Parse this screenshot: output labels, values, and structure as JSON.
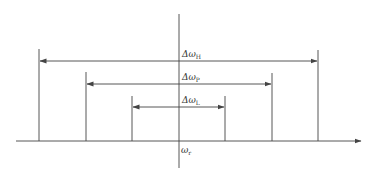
{
  "diagram": {
    "type": "bandwidth-diagram",
    "axis": {
      "label": "ω",
      "subscript": "r",
      "color": "#444444"
    },
    "bands": [
      {
        "id": "H",
        "label": "Δω",
        "subscript": "H",
        "left_x": 39,
        "right_x": 318,
        "top_y": 49,
        "arrow_y": 61
      },
      {
        "id": "P",
        "label": "Δω",
        "subscript": "P",
        "left_x": 86,
        "right_x": 272,
        "top_y": 72,
        "arrow_y": 84
      },
      {
        "id": "L",
        "label": "Δω",
        "subscript": "L",
        "left_x": 132,
        "right_x": 225,
        "top_y": 96,
        "arrow_y": 107
      }
    ]
  }
}
